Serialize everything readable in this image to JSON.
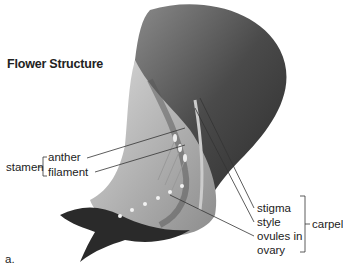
{
  "title": "Flower Structure",
  "labels": {
    "stamen": "stamen",
    "anther": "anther",
    "filament": "filament",
    "stigma": "stigma",
    "style": "style",
    "ovules_in": "ovules in",
    "ovary": "ovary",
    "carpel": "carpel"
  },
  "panel_label": "a.",
  "colors": {
    "petal_dark": "#3a3a3a",
    "petal_mid": "#6d6d6d",
    "petal_light": "#b8b8b8",
    "line": "#333333"
  }
}
